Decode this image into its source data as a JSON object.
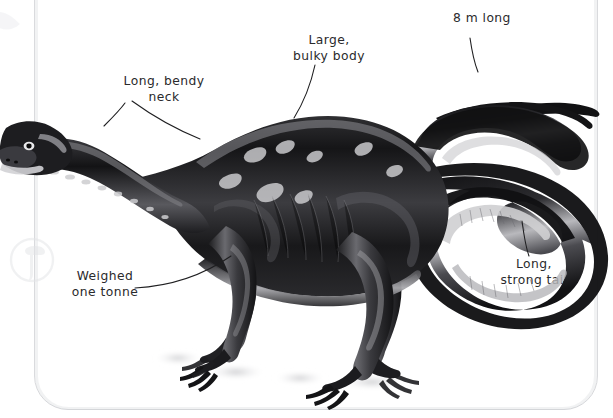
{
  "page": {
    "type": "illustrated-book-page",
    "background_color": "#ffffff",
    "frame_color": "#d9dadd",
    "text_color": "#2a2a2c"
  },
  "watermark": {
    "name": "circular-dinosaur-head-logo",
    "color": "#e4e5e8",
    "visible": true
  },
  "illustration": {
    "name": "dinosaur",
    "description": "Long-necked sauropodomorph dinosaur walking to the left with a long S-curved tail raised behind",
    "fill_dark": "#1b1b1d",
    "fill_mid": "#4a4a4d",
    "fill_light": "#c9c9cb",
    "shadow_color": "#d5d5d8"
  },
  "labels": [
    {
      "id": "neck",
      "text": "Long, bendy\nneck",
      "align": "center"
    },
    {
      "id": "body",
      "text": "Large,\nbulky body",
      "align": "center"
    },
    {
      "id": "length",
      "text": "8 m long",
      "align": "center"
    },
    {
      "id": "weight",
      "text": "Weighed\none tonne",
      "align": "center"
    },
    {
      "id": "tail",
      "text": "Long,\nstrong tail",
      "align": "center"
    }
  ],
  "leader_lines": {
    "stroke": "#1f1f21",
    "width": 1.1,
    "count": 5
  }
}
